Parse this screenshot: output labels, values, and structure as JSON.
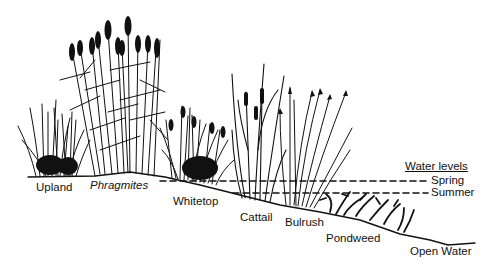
{
  "diagram": {
    "type": "wetland vegetation zonation cross-section",
    "zones": [
      {
        "label": "Upland",
        "italic": false
      },
      {
        "label": "Phragmites",
        "italic": true
      },
      {
        "label": "Whitetop",
        "italic": false
      },
      {
        "label": "Cattail",
        "italic": false
      },
      {
        "label": "Bulrush",
        "italic": false
      },
      {
        "label": "Pondweed",
        "italic": false
      },
      {
        "label": "Open Water",
        "italic": false
      }
    ],
    "legend": {
      "title": "Water levels",
      "lines": [
        {
          "label": "Spring",
          "style": "dashed"
        },
        {
          "label": "Summer",
          "style": "dashed"
        }
      ]
    },
    "colors": {
      "ink": "#111111",
      "background": "#ffffff"
    }
  }
}
